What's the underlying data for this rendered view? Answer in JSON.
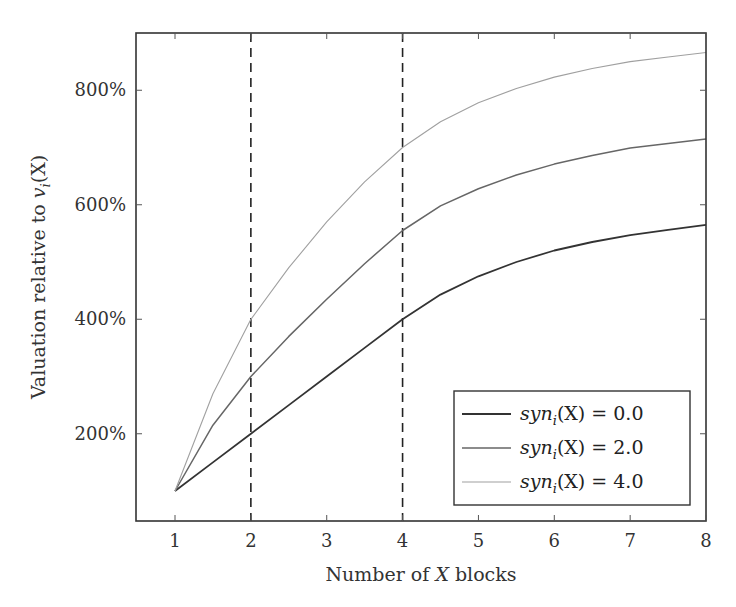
{
  "chart_data": {
    "type": "line",
    "title": "",
    "xlabel": "Number of X blocks",
    "ylabel": "Valuation relative to v_i(X)",
    "xlim": [
      0.5,
      8
    ],
    "ylim": [
      0,
      900
    ],
    "x_ticks": [
      1,
      2,
      3,
      4,
      5,
      6,
      7,
      8
    ],
    "x_tick_labels": [
      "1",
      "2",
      "3",
      "4",
      "5",
      "6",
      "7",
      "8"
    ],
    "y_ticks": [
      200,
      400,
      600,
      800
    ],
    "y_tick_labels": [
      "200%",
      "400%",
      "600%",
      "800%"
    ],
    "grid": false,
    "vertical_dashed_lines": [
      2,
      4
    ],
    "legend_position": "lower right",
    "x": [
      1,
      1.5,
      2,
      2.5,
      3,
      3.5,
      4,
      4.5,
      5,
      5.5,
      6,
      6.5,
      7,
      7.5,
      8
    ],
    "series": [
      {
        "name": "syn_i(X) = 0.0",
        "color": "#333333",
        "values": [
          100,
          150,
          200,
          250,
          300,
          350,
          400,
          443,
          475,
          500,
          520,
          535,
          547,
          556,
          565
        ]
      },
      {
        "name": "syn_i(X) = 2.0",
        "color": "#666666",
        "values": [
          100,
          215,
          300,
          370,
          435,
          497,
          555,
          598,
          628,
          652,
          671,
          686,
          699,
          707,
          715
        ]
      },
      {
        "name": "syn_i(X) = 4.0",
        "color": "#a0a0a0",
        "values": [
          100,
          270,
          400,
          490,
          570,
          640,
          700,
          745,
          778,
          803,
          823,
          838,
          850,
          858,
          866
        ]
      }
    ]
  },
  "legend": {
    "items": [
      {
        "prefix": "syn",
        "sub": "i",
        "suffix": "(X) = 0.0"
      },
      {
        "prefix": "syn",
        "sub": "i",
        "suffix": "(X) = 2.0"
      },
      {
        "prefix": "syn",
        "sub": "i",
        "suffix": "(X) = 4.0"
      }
    ]
  },
  "axes": {
    "xlabel_pre": "Number of ",
    "xlabel_var": "X",
    "xlabel_post": " blocks",
    "ylabel_pre": "Valuation relative to ",
    "ylabel_var": "v",
    "ylabel_sub": "i",
    "ylabel_post": "(X)"
  }
}
